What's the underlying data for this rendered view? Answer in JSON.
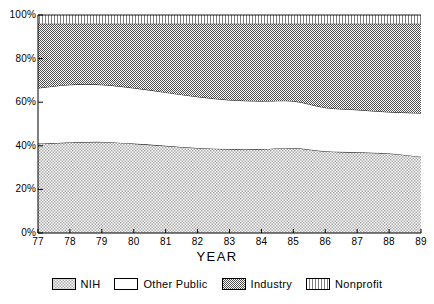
{
  "chart_data": {
    "type": "area",
    "stacked": true,
    "stack_mode": "percent",
    "title": "",
    "xlabel": "YEAR",
    "ylabel": "",
    "grid": false,
    "legend_position": "bottom",
    "categories": [
      "77",
      "78",
      "79",
      "80",
      "81",
      "82",
      "83",
      "84",
      "85",
      "86",
      "87",
      "88",
      "89"
    ],
    "x": [
      77,
      78,
      79,
      80,
      81,
      82,
      83,
      84,
      85,
      86,
      87,
      88,
      89
    ],
    "xlim": [
      77,
      89
    ],
    "ylim": [
      0,
      100
    ],
    "yticks": [
      0,
      20,
      40,
      60,
      80,
      100
    ],
    "ytick_labels": [
      "0%",
      "20%",
      "40%",
      "60%",
      "80%",
      "100%"
    ],
    "xtick_labels": [
      "77",
      "78",
      "79",
      "80",
      "81",
      "82",
      "83",
      "84",
      "85",
      "86",
      "87",
      "88",
      "89"
    ],
    "series": [
      {
        "name": "NIH",
        "pattern": "light-cross-hatch",
        "values": [
          41.0,
          41.5,
          41.8,
          41.0,
          40.0,
          39.0,
          38.5,
          38.5,
          39.0,
          37.5,
          37.0,
          36.5,
          35.0
        ]
      },
      {
        "name": "Other Public",
        "pattern": "solid-white",
        "values": [
          25.5,
          26.5,
          26.2,
          25.5,
          24.5,
          23.5,
          22.5,
          22.0,
          21.5,
          20.0,
          19.5,
          19.0,
          20.0
        ]
      },
      {
        "name": "Industry",
        "pattern": "dark-cross-hatch",
        "values": [
          29.5,
          28.0,
          28.0,
          29.5,
          31.5,
          33.5,
          35.0,
          35.5,
          35.5,
          38.5,
          39.5,
          40.5,
          41.0
        ]
      },
      {
        "name": "Nonprofit",
        "pattern": "vertical-lines",
        "values": [
          4.0,
          4.0,
          4.0,
          4.0,
          4.0,
          4.0,
          4.0,
          4.0,
          4.0,
          4.0,
          4.0,
          4.0,
          4.0
        ]
      }
    ],
    "cumulative_boundaries": {
      "nih_top": [
        41.0,
        41.5,
        41.8,
        41.0,
        40.0,
        39.0,
        38.5,
        38.5,
        39.0,
        37.5,
        37.0,
        36.5,
        35.0
      ],
      "other_public_top": [
        66.5,
        68.0,
        68.0,
        66.5,
        64.5,
        62.5,
        61.0,
        60.5,
        60.5,
        57.5,
        56.5,
        55.5,
        55.0
      ],
      "industry_top": [
        96.0,
        96.0,
        96.0,
        96.0,
        96.0,
        96.0,
        96.0,
        96.0,
        96.0,
        96.0,
        96.0,
        96.0,
        96.0
      ],
      "nonprofit_top": [
        100,
        100,
        100,
        100,
        100,
        100,
        100,
        100,
        100,
        100,
        100,
        100,
        100
      ]
    },
    "colors": {
      "nih": "#d9d9d9",
      "other_public": "#ffffff",
      "industry": "#9a9a9a",
      "nonprofit": "#e6e6e6",
      "outline": "#000000",
      "axis": "#000000"
    }
  },
  "legend": {
    "items": [
      {
        "label": "NIH",
        "swatch": "light-cross-hatch-swatch"
      },
      {
        "label": "Other Public",
        "swatch": "solid-white-swatch"
      },
      {
        "label": "Industry",
        "swatch": "dark-cross-hatch-swatch"
      },
      {
        "label": "Nonprofit",
        "swatch": "vertical-lines-swatch"
      }
    ]
  },
  "axis": {
    "x_title": "YEAR"
  }
}
